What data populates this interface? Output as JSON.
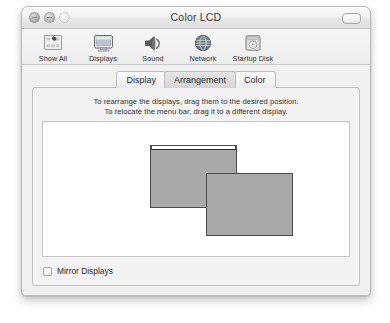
{
  "window": {
    "title": "Color LCD",
    "controls": {
      "close": "close-button",
      "minimize": "minimize-button",
      "zoom": "zoom-button",
      "toolbar_toggle": "toolbar-toggle-button"
    }
  },
  "toolbar": {
    "items": [
      {
        "label": "Show All",
        "icon": "show-all-icon"
      },
      {
        "label": "Displays",
        "icon": "displays-icon"
      },
      {
        "label": "Sound",
        "icon": "sound-icon"
      },
      {
        "label": "Network",
        "icon": "network-icon"
      },
      {
        "label": "Startup Disk",
        "icon": "startup-disk-icon"
      }
    ]
  },
  "tabs": [
    {
      "label": "Display",
      "selected": false
    },
    {
      "label": "Arrangement",
      "selected": true
    },
    {
      "label": "Color",
      "selected": false
    }
  ],
  "arrangement": {
    "instruction_line1": "To rearrange the displays, drag them to the desired position.",
    "instruction_line2": "To relocate the menu bar, drag it to a different display.",
    "displays": [
      {
        "name": "display-primary",
        "has_menu_bar": true,
        "left": 107,
        "top": 23,
        "width": 87,
        "height": 63
      },
      {
        "name": "display-secondary",
        "has_menu_bar": false,
        "left": 163,
        "top": 51,
        "width": 87,
        "height": 63
      }
    ]
  },
  "mirror": {
    "label": "Mirror Displays",
    "checked": false
  },
  "colors": {
    "display_fill": "#a9a9a9",
    "display_border": "#4c4c4c",
    "canvas_bg": "#ffffff",
    "panel_bg": "#f3f3f3",
    "titlebar_text": "#3a3a3a"
  }
}
